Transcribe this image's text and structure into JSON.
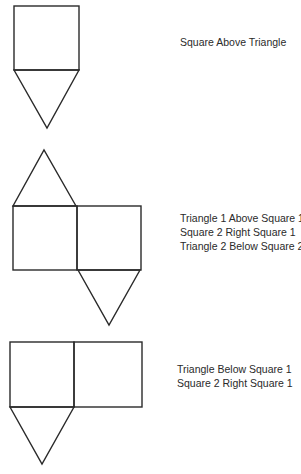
{
  "figures": [
    {
      "id": "figure-1",
      "labels": [
        "Square Above Triangle"
      ]
    },
    {
      "id": "figure-2",
      "labels": [
        "Triangle 1 Above Square 1",
        "Square 2 Right Square 1",
        "Triangle 2 Below Square 2"
      ]
    },
    {
      "id": "figure-3",
      "labels": [
        "Triangle Below Square 1",
        "Square 2 Right Square 1"
      ]
    }
  ],
  "style": {
    "stroke_color": "#2a2a2a",
    "background": "#ffffff"
  }
}
